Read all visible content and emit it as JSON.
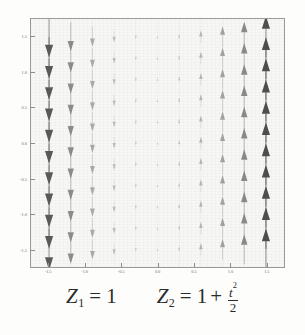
{
  "figure": {
    "kind": "slope-field",
    "background_color": "#fdfdfc",
    "panel_color": "#f7f7f5",
    "frame_color": "#9a9a98"
  },
  "caption": {
    "left": {
      "var": "Z",
      "sub": "1",
      "eq": "=",
      "value": "1"
    },
    "right": {
      "var": "Z",
      "sub": "2",
      "eq": "=",
      "one": "1",
      "plus": "+",
      "numerator_var": "t",
      "numerator_exp": "2",
      "denominator": "2"
    }
  },
  "axes": {
    "x_ticks": [
      "-1.5",
      "-1.0",
      "-0.5",
      "0.0",
      "0.5",
      "1.0",
      "1.5"
    ],
    "y_ticks": [
      "1.5",
      "1.0",
      "0.5",
      "0.0",
      "-0.5",
      "-1.0",
      "-1.5"
    ],
    "x_range": [
      -1.75,
      1.75
    ],
    "y_range": [
      -1.75,
      1.75
    ],
    "tick_color": "#6f6f6d"
  },
  "chart_data": {
    "type": "scatter",
    "title": "",
    "xlabel": "",
    "ylabel": "",
    "xlim": [
      -1.75,
      1.75
    ],
    "ylim": [
      -1.75,
      1.75
    ],
    "grid": false,
    "legend": "none",
    "grid_x": [
      -1.5,
      -1.2,
      -0.9,
      -0.6,
      -0.3,
      0.0,
      0.3,
      0.6,
      0.9,
      1.2,
      1.5
    ],
    "grid_y": [
      1.5,
      1.2,
      0.9,
      0.6,
      0.3,
      0.0,
      -0.3,
      -0.6,
      -0.9,
      -1.2,
      -1.5
    ],
    "column_vectors": [
      {
        "x": -1.5,
        "dy": -1.0,
        "direction": "down",
        "magnitude": 1.0,
        "shade": "#5a5a5a"
      },
      {
        "x": -1.2,
        "dy": -0.7,
        "direction": "down",
        "magnitude": 0.7,
        "shade": "#8d8d8d"
      },
      {
        "x": -0.9,
        "dy": -0.48,
        "direction": "down",
        "magnitude": 0.48,
        "shade": "#ababab"
      },
      {
        "x": -0.6,
        "dy": -0.28,
        "direction": "down",
        "magnitude": 0.28,
        "shade": "#bdbdbd"
      },
      {
        "x": -0.3,
        "dy": -0.12,
        "direction": "down",
        "magnitude": 0.12,
        "shade": "#c9c9c9"
      },
      {
        "x": 0.0,
        "dy": 0.05,
        "direction": "up",
        "magnitude": 0.05,
        "shade": "#cfcfcf"
      },
      {
        "x": 0.3,
        "dy": 0.14,
        "direction": "up",
        "magnitude": 0.14,
        "shade": "#c4c4c4"
      },
      {
        "x": 0.6,
        "dy": 0.3,
        "direction": "up",
        "magnitude": 0.3,
        "shade": "#b4b4b4"
      },
      {
        "x": 0.9,
        "dy": 0.5,
        "direction": "up",
        "magnitude": 0.5,
        "shade": "#a3a3a3"
      },
      {
        "x": 1.2,
        "dy": 0.72,
        "direction": "up",
        "magnitude": 0.72,
        "shade": "#8a8a8a"
      },
      {
        "x": 1.5,
        "dy": 1.0,
        "direction": "up",
        "magnitude": 1.0,
        "shade": "#4f4f4f"
      }
    ]
  }
}
